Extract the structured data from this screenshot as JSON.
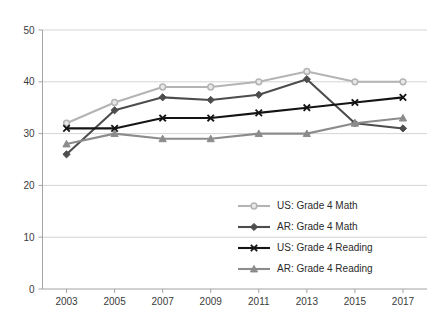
{
  "chart_data": {
    "type": "line",
    "title": "",
    "subtitle": "",
    "xlabel": "",
    "ylabel": "",
    "x": [
      2003,
      2005,
      2007,
      2009,
      2011,
      2013,
      2015,
      2017
    ],
    "categories": [
      "2003",
      "2005",
      "2007",
      "2009",
      "2011",
      "2013",
      "2015",
      "2017"
    ],
    "ylim": [
      0,
      50
    ],
    "yticks": [
      0,
      10,
      20,
      30,
      40,
      50
    ],
    "ytick_labels": [
      "0",
      "10",
      "20",
      "30",
      "40",
      "50"
    ],
    "grid": true,
    "grid_axis": "y",
    "legend_position": "inside-lower-right",
    "series": [
      {
        "name": "US: Grade 4 Math",
        "values": [
          32,
          36,
          39,
          39,
          40,
          42,
          40,
          40
        ],
        "color": "#b4b4b4",
        "marker": "circle"
      },
      {
        "name": "AR: Grade 4 Math",
        "values": [
          26,
          34.5,
          37,
          36.5,
          37.5,
          40.5,
          32,
          31
        ],
        "color": "#4d4d4d",
        "marker": "diamond"
      },
      {
        "name": "US: Grade 4 Reading",
        "values": [
          31,
          31,
          33,
          33,
          34,
          35,
          36,
          37
        ],
        "color": "#141414",
        "marker": "x"
      },
      {
        "name": "AR: Grade 4 Reading",
        "values": [
          28,
          30,
          29,
          29,
          30,
          30,
          32,
          33
        ],
        "color": "#8c8c8c",
        "marker": "triangle"
      }
    ],
    "legend_entries": [
      {
        "label": "US: Grade 4 Math",
        "color": "#b4b4b4",
        "marker": "circle"
      },
      {
        "label": "AR: Grade 4 Math",
        "color": "#4d4d4d",
        "marker": "diamond"
      },
      {
        "label": "US: Grade 4 Reading",
        "color": "#141414",
        "marker": "x"
      },
      {
        "label": "AR: Grade 4 Reading",
        "color": "#8c8c8c",
        "marker": "triangle"
      }
    ]
  }
}
